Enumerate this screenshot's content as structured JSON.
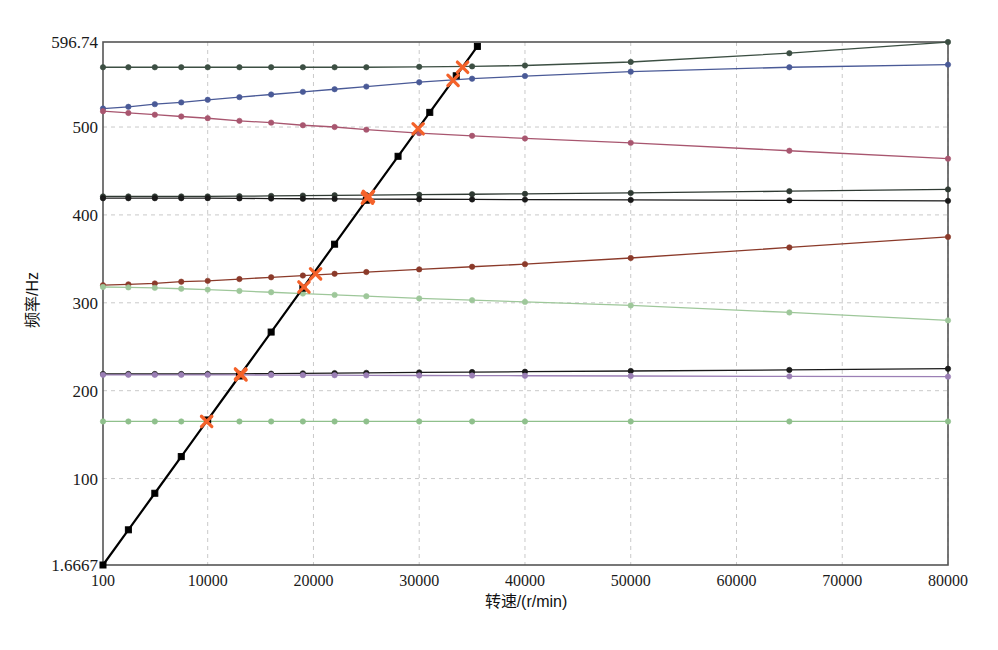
{
  "chart_data": {
    "type": "line",
    "title": "",
    "xlabel": "转速/(r/min)",
    "ylabel": "频率/Hz",
    "xlim": [
      100,
      80000
    ],
    "ylim": [
      1.6667,
      596.74
    ],
    "grid": true,
    "legend": "none",
    "x_ticks": [
      100,
      10000,
      20000,
      30000,
      40000,
      50000,
      60000,
      70000,
      80000
    ],
    "x_tick_labels": [
      "100",
      "10000",
      "20000",
      "30000",
      "40000",
      "50000",
      "60000",
      "70000",
      "80000"
    ],
    "y_ticks": [
      1.6667,
      100,
      200,
      300,
      400,
      500,
      596.74
    ],
    "y_tick_labels": [
      "1.6667",
      "100",
      "200",
      "300",
      "400",
      "500",
      "596.74"
    ],
    "x_sample_points": [
      100,
      2500,
      5000,
      7500,
      10000,
      13000,
      16000,
      19000,
      22000,
      25000,
      30000,
      35000,
      40000,
      50000,
      65000,
      80000
    ],
    "series": [
      {
        "name": "mode-8-forward",
        "color": "#3c4f43",
        "marker": "circle",
        "x": [
          100,
          2500,
          5000,
          7500,
          10000,
          13000,
          16000,
          19000,
          22000,
          25000,
          30000,
          35000,
          40000,
          50000,
          65000,
          80000
        ],
        "values": [
          568,
          568,
          568,
          568,
          568,
          568,
          568,
          568,
          568,
          568,
          568.5,
          569,
          570,
          574,
          584,
          596.7
        ]
      },
      {
        "name": "mode-7-forward",
        "color": "#4a5a97",
        "marker": "circle",
        "x": [
          100,
          2500,
          5000,
          7500,
          10000,
          13000,
          16000,
          19000,
          22000,
          25000,
          30000,
          35000,
          40000,
          50000,
          65000,
          80000
        ],
        "values": [
          521,
          523,
          526,
          528,
          531,
          534,
          537,
          540,
          543,
          546,
          551,
          555,
          558,
          563,
          568,
          571
        ]
      },
      {
        "name": "mode-7-backward",
        "color": "#a8566f",
        "marker": "circle",
        "x": [
          100,
          2500,
          5000,
          7500,
          10000,
          13000,
          16000,
          19000,
          22000,
          25000,
          30000,
          35000,
          40000,
          50000,
          65000,
          80000
        ],
        "values": [
          518,
          516,
          514,
          512,
          510,
          507,
          505,
          502,
          500,
          497,
          493,
          490,
          487,
          482,
          473,
          464
        ]
      },
      {
        "name": "mode-6-forward",
        "color": "#2f3a33",
        "marker": "circle",
        "x": [
          100,
          2500,
          5000,
          7500,
          10000,
          13000,
          16000,
          19000,
          22000,
          25000,
          30000,
          35000,
          40000,
          50000,
          65000,
          80000
        ],
        "values": [
          421,
          421,
          421,
          421,
          421,
          421.3,
          421.6,
          422,
          422.3,
          422.6,
          423,
          423.5,
          424,
          425,
          427,
          429
        ]
      },
      {
        "name": "mode-6-backward",
        "color": "#1a1a1a",
        "marker": "circle",
        "x": [
          100,
          2500,
          5000,
          7500,
          10000,
          13000,
          16000,
          19000,
          22000,
          25000,
          30000,
          35000,
          40000,
          50000,
          65000,
          80000
        ],
        "values": [
          419,
          419,
          419,
          419,
          419,
          418.8,
          418.6,
          418.4,
          418.2,
          418,
          417.8,
          417.6,
          417.4,
          417,
          416.5,
          416
        ]
      },
      {
        "name": "mode-5-forward",
        "color": "#8b3a2a",
        "marker": "circle",
        "x": [
          100,
          2500,
          5000,
          7500,
          10000,
          13000,
          16000,
          19000,
          22000,
          25000,
          30000,
          35000,
          40000,
          50000,
          65000,
          80000
        ],
        "values": [
          320,
          321,
          322,
          324,
          325,
          327,
          329,
          331,
          333,
          335,
          338,
          341,
          344,
          351,
          363,
          375
        ]
      },
      {
        "name": "mode-5-backward",
        "color": "#9ec79a",
        "marker": "circle",
        "x": [
          100,
          2500,
          5000,
          7500,
          10000,
          13000,
          16000,
          19000,
          22000,
          25000,
          30000,
          35000,
          40000,
          50000,
          65000,
          80000
        ],
        "values": [
          318,
          317.5,
          317,
          316,
          315,
          313.5,
          312,
          310.5,
          309,
          307.5,
          305,
          303,
          301,
          297,
          289,
          280
        ]
      },
      {
        "name": "mode-4-forward",
        "color": "#1a1a1a",
        "marker": "circle",
        "x": [
          100,
          2500,
          5000,
          7500,
          10000,
          13000,
          16000,
          19000,
          22000,
          25000,
          30000,
          35000,
          40000,
          50000,
          65000,
          80000
        ],
        "values": [
          219,
          219,
          219,
          219,
          219,
          219.2,
          219.4,
          219.7,
          220,
          220.3,
          220.8,
          221.2,
          221.6,
          222.4,
          223.6,
          225
        ]
      },
      {
        "name": "mode-4-backward",
        "color": "#9b7fb5",
        "marker": "circle",
        "x": [
          100,
          2500,
          5000,
          7500,
          10000,
          13000,
          16000,
          19000,
          22000,
          25000,
          30000,
          35000,
          40000,
          50000,
          65000,
          80000
        ],
        "values": [
          218,
          218,
          218,
          218,
          218,
          217.9,
          217.8,
          217.7,
          217.6,
          217.5,
          217.3,
          217.2,
          217,
          216.7,
          216.3,
          216
        ]
      },
      {
        "name": "mode-3-rigid",
        "color": "#8fc08c",
        "marker": "circle",
        "x": [
          100,
          2500,
          5000,
          7500,
          10000,
          13000,
          16000,
          19000,
          22000,
          25000,
          30000,
          35000,
          40000,
          50000,
          65000,
          80000
        ],
        "values": [
          165,
          165,
          165,
          165,
          165,
          165,
          165,
          165,
          165,
          165,
          165,
          165,
          165,
          165,
          165,
          165
        ]
      },
      {
        "name": "synchronous-1x-line",
        "color": "#000000",
        "marker": "square",
        "x": [
          100,
          2500,
          5000,
          7500,
          10000,
          13000,
          16000,
          19000,
          22000,
          25000,
          28000,
          31000,
          33500,
          35500
        ],
        "values": [
          1.6667,
          41.7,
          83.3,
          125,
          166.7,
          216.7,
          266.7,
          316.7,
          366.7,
          416.7,
          466.7,
          516.7,
          558.3,
          591.7
        ]
      }
    ],
    "critical_points": {
      "name": "critical-speed-intersections",
      "color": "#f4622a",
      "marker": "x-cross",
      "points": [
        {
          "x": 9900,
          "y": 165
        },
        {
          "x": 13100,
          "y": 219
        },
        {
          "x": 13150,
          "y": 218
        },
        {
          "x": 19100,
          "y": 318
        },
        {
          "x": 20200,
          "y": 333
        },
        {
          "x": 25100,
          "y": 419
        },
        {
          "x": 25200,
          "y": 421
        },
        {
          "x": 29900,
          "y": 498
        },
        {
          "x": 33200,
          "y": 553
        },
        {
          "x": 34100,
          "y": 568
        }
      ]
    }
  }
}
